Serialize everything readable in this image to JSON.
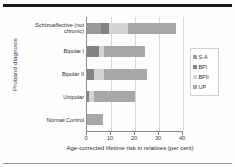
{
  "figure": {
    "ylabel": "Proband diagnosis",
    "xlabel": "Age-corrected lifetime risk in relatives (per cent)"
  },
  "legend": {
    "title": "",
    "position": "right",
    "items": [
      {
        "label": "S-A",
        "color": "#9a9a9a"
      },
      {
        "label": "BPI",
        "color": "#838383"
      },
      {
        "label": "BPII",
        "color": "#d3d3d3"
      },
      {
        "label": "UP",
        "color": "#a8a8a8"
      }
    ]
  },
  "chart_data": {
    "type": "bar",
    "orientation": "horizontal",
    "stacked": true,
    "title": "",
    "xlabel": "Age-corrected lifetime risk in relatives (per cent)",
    "ylabel": "Proband diagnosis",
    "xlim": [
      0,
      40
    ],
    "xticks": [
      0,
      10,
      20,
      30,
      40
    ],
    "grid": true,
    "categories": [
      "Schizoaffective (not chronic)",
      "Bipolar I",
      "Bipolar II",
      "Unipolar",
      "Normal Control"
    ],
    "series": [
      {
        "name": "S-A",
        "color": "#9a9a9a",
        "values": [
          6.0,
          0.0,
          0.0,
          0.0,
          0.0
        ]
      },
      {
        "name": "BPI",
        "color": "#838383",
        "values": [
          3.0,
          5.0,
          3.0,
          1.0,
          0.0
        ]
      },
      {
        "name": "BPII",
        "color": "#d3d3d3",
        "values": [
          8.0,
          2.0,
          4.0,
          2.0,
          0.0
        ]
      },
      {
        "name": "UP",
        "color": "#a8a8a8",
        "values": [
          20.0,
          17.0,
          18.0,
          17.0,
          6.5
        ]
      }
    ],
    "totals": [
      37.0,
      24.0,
      25.0,
      20.0,
      6.5
    ]
  }
}
